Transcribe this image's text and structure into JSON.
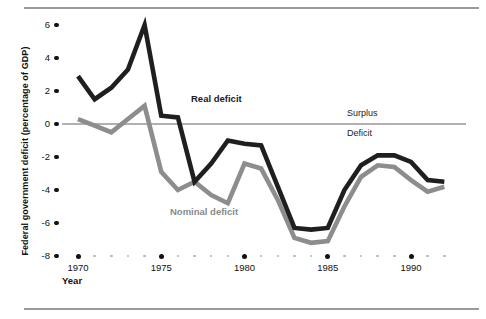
{
  "figure": {
    "ylabel": "Federal government deficit (percentage of GDP)",
    "xlabel": "Year",
    "zero_labels": {
      "above": "Surplus",
      "below": "Deficit"
    }
  },
  "chart_data": {
    "type": "line",
    "title": "",
    "xlabel": "Year",
    "ylabel": "Federal government deficit (percentage of GDP)",
    "xlim": [
      1969,
      1992
    ],
    "ylim": [
      -8,
      7
    ],
    "yticks": [
      6,
      4,
      2,
      0,
      -2,
      -4,
      -6,
      -8
    ],
    "ytick_labels": [
      "6",
      "4",
      "2",
      "0",
      "-2",
      "-4",
      "-6",
      "-8"
    ],
    "xticks": [
      1970,
      1975,
      1980,
      1985,
      1990
    ],
    "xtick_labels": [
      "1970",
      "1975",
      "1980",
      "1985",
      "1990"
    ],
    "minor_xticks": [
      1971,
      1972,
      1973,
      1974,
      1976,
      1977,
      1978,
      1979,
      1981,
      1982,
      1983,
      1984,
      1986,
      1987,
      1988,
      1989,
      1991,
      1992
    ],
    "grid": false,
    "legend": "inline-annotations",
    "zero_line": 0,
    "annotations": [
      {
        "text": "Surplus",
        "x": 1987.5,
        "y": 0.6
      },
      {
        "text": "Deficit",
        "x": 1987.5,
        "y": -0.55
      },
      {
        "text": "Real deficit",
        "x": 1977.0,
        "y": 1.55
      },
      {
        "text": "Nominal deficit",
        "x": 1978.8,
        "y": -5.05
      }
    ],
    "x": [
      1970,
      1971,
      1972,
      1973,
      1974,
      1975,
      1976,
      1977,
      1978,
      1979,
      1980,
      1981,
      1982,
      1983,
      1984,
      1985,
      1986,
      1987,
      1988,
      1989,
      1990,
      1991,
      1992
    ],
    "series": [
      {
        "name": "Real deficit",
        "color": "#1f1f1f",
        "values": [
          2.9,
          1.5,
          2.2,
          3.3,
          6.0,
          0.5,
          0.4,
          -3.5,
          -2.4,
          -1.0,
          -1.2,
          -1.3,
          -3.8,
          -6.3,
          -6.4,
          -6.3,
          -4.0,
          -2.5,
          -1.9,
          -1.9,
          -2.3,
          -3.4,
          -3.5
        ]
      },
      {
        "name": "Nominal deficit",
        "color": "#8d8d8d",
        "values": [
          0.3,
          -0.1,
          -0.5,
          0.3,
          1.1,
          -2.9,
          -4.0,
          -3.5,
          -4.3,
          -4.8,
          -2.4,
          -2.7,
          -4.6,
          -6.9,
          -7.2,
          -7.1,
          -5.0,
          -3.2,
          -2.5,
          -2.6,
          -3.4,
          -4.1,
          -3.8
        ]
      }
    ]
  }
}
